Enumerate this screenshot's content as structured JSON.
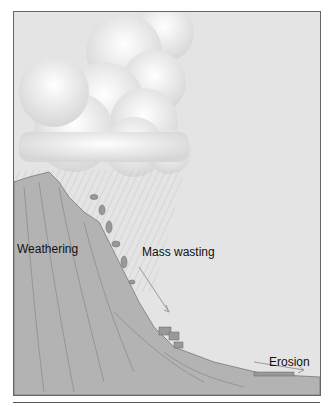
{
  "diagram": {
    "labels": {
      "weathering": "Weathering",
      "mass_wasting": "Mass wasting",
      "erosion": "Erosion"
    },
    "colors": {
      "sky": "#e4e4e4",
      "ground": "#b3b3b3",
      "cloud": "#f4f4f4",
      "frame": "#666666"
    }
  }
}
